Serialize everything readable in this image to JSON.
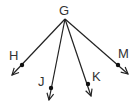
{
  "diagram": {
    "type": "rays-from-common-endpoint",
    "vertex": {
      "label": "G",
      "x": 65,
      "y": 19,
      "label_x": 59,
      "label_y": 15
    },
    "rays": [
      {
        "label": "H",
        "point": {
          "x": 22,
          "y": 65
        },
        "end": {
          "x": 12,
          "y": 75
        },
        "label_x": 9,
        "label_y": 60
      },
      {
        "label": "J",
        "point": {
          "x": 51,
          "y": 88
        },
        "end": {
          "x": 49,
          "y": 100
        },
        "label_x": 38,
        "label_y": 86
      },
      {
        "label": "K",
        "point": {
          "x": 88,
          "y": 84
        },
        "end": {
          "x": 91,
          "y": 96
        },
        "label_x": 92,
        "label_y": 81
      },
      {
        "label": "M",
        "point": {
          "x": 118,
          "y": 65
        },
        "end": {
          "x": 128,
          "y": 74
        },
        "label_x": 118,
        "label_y": 58
      }
    ],
    "colors": {
      "line": "#222222",
      "text": "#333333",
      "background": "#ffffff"
    }
  }
}
